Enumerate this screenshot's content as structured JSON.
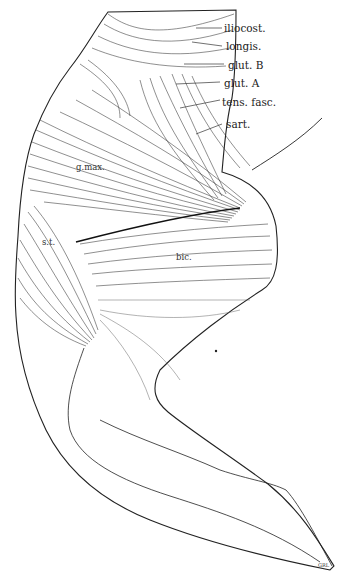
{
  "figure": {
    "background": "#ffffff",
    "ink": "#222222",
    "labels": [
      {
        "id": "iliocost",
        "text": "iliocost.",
        "x": 224,
        "y": 32
      },
      {
        "id": "longis",
        "text": "longis.",
        "x": 226,
        "y": 50
      },
      {
        "id": "glut_b",
        "text": "glut. B",
        "x": 228,
        "y": 69
      },
      {
        "id": "glut_a",
        "text": "glut. A",
        "x": 224,
        "y": 87
      },
      {
        "id": "tens_fasc",
        "text": "tens. fasc.",
        "x": 222,
        "y": 106
      },
      {
        "id": "sart",
        "text": "sart.",
        "x": 226,
        "y": 128
      },
      {
        "id": "g_max",
        "text": "g.max.",
        "x": 76,
        "y": 170
      },
      {
        "id": "s_t",
        "text": "s.t.",
        "x": 42,
        "y": 245
      },
      {
        "id": "bic",
        "text": "bic.",
        "x": 176,
        "y": 260
      },
      {
        "id": "signature",
        "text": "GRL",
        "x": 318,
        "y": 567
      }
    ]
  }
}
